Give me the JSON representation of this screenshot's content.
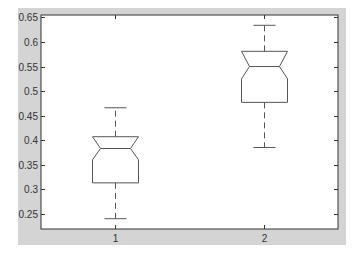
{
  "chart_data": {
    "type": "box",
    "title": "",
    "xlabel": "",
    "ylabel": "",
    "notched": true,
    "categories": [
      "1",
      "2"
    ],
    "ylim": [
      0.219,
      0.655
    ],
    "yticks": [
      0.25,
      0.3,
      0.35,
      0.4,
      0.45,
      0.5,
      0.55,
      0.6,
      0.65
    ],
    "ytick_labels": [
      "0.25",
      "0.3",
      "0.35",
      "0.4",
      "0.45",
      "0.5",
      "0.55",
      "0.6",
      "0.65"
    ],
    "xticks": [
      1,
      2
    ],
    "xtick_labels": [
      "1",
      "2"
    ],
    "grid": false,
    "legend": null,
    "boxes": [
      {
        "label": "1",
        "whisker_low": 0.24,
        "q1": 0.313,
        "notch_low": 0.36,
        "median": 0.383,
        "notch_high": 0.407,
        "q3": 0.407,
        "whisker_high": 0.466
      },
      {
        "label": "2",
        "whisker_low": 0.385,
        "q1": 0.477,
        "notch_low": 0.525,
        "median": 0.55,
        "notch_high": 0.581,
        "q3": 0.581,
        "whisker_high": 0.634
      }
    ]
  },
  "colors": {
    "figure_bg": "#d4d4d4",
    "axes_bg": "#ffffff",
    "box_line": "#555555",
    "axis_line": "#333333",
    "text": "#333333"
  }
}
